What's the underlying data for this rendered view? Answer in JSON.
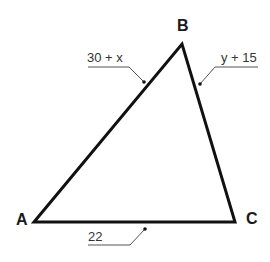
{
  "diagram": {
    "type": "triangle",
    "vertices": [
      {
        "name": "A",
        "label": "A"
      },
      {
        "name": "B",
        "label": "B"
      },
      {
        "name": "C",
        "label": "C"
      }
    ],
    "sides": [
      {
        "segment": "AB",
        "label": "30 + x"
      },
      {
        "segment": "BC",
        "label": "y + 15"
      },
      {
        "segment": "AC",
        "label": "22"
      }
    ],
    "colors": {
      "stroke": "#111111",
      "leader": "#555555",
      "background": "#ffffff"
    }
  }
}
